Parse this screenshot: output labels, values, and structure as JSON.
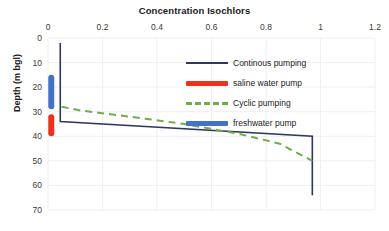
{
  "chart_data": {
    "type": "line",
    "title": "Concentration Isochlors",
    "xlabel": "",
    "ylabel": "Depth (m bgl)",
    "xlim": [
      0,
      1.2
    ],
    "ylim": [
      0,
      70
    ],
    "y_inverted": true,
    "grid": true,
    "legend_position": "inside-top-right",
    "xticks": [
      "0",
      "0.2",
      "0.4",
      "0.6",
      "0.8",
      "1",
      "1.2"
    ],
    "xtick_values": [
      0,
      0.2,
      0.4,
      0.6,
      0.8,
      1,
      1.2
    ],
    "yticks": [
      "0",
      "10",
      "20",
      "30",
      "40",
      "50",
      "60",
      "70"
    ],
    "ytick_values": [
      0,
      10,
      20,
      30,
      40,
      50,
      60,
      70
    ],
    "series": [
      {
        "name": "Continous pumping",
        "type": "line",
        "style": "solid",
        "color": "#2E3A5C",
        "width": 1.6,
        "points": [
          [
            0.045,
            2
          ],
          [
            0.045,
            34
          ],
          [
            0.97,
            40
          ],
          [
            0.97,
            64
          ]
        ]
      },
      {
        "name": "saline water pump",
        "type": "bar",
        "style": "thick-vertical-bar",
        "color": "#E8341C",
        "x": 0.012,
        "depth_top": 31,
        "depth_bottom": 40
      },
      {
        "name": "Cyclic pumping",
        "type": "line",
        "style": "dashed",
        "color": "#70AD47",
        "width": 2,
        "points": [
          [
            0.05,
            28
          ],
          [
            0.12,
            29.5
          ],
          [
            0.3,
            32
          ],
          [
            0.5,
            35
          ],
          [
            0.7,
            39
          ],
          [
            0.85,
            43
          ],
          [
            0.97,
            50
          ]
        ]
      },
      {
        "name": "freshwater pump",
        "type": "bar",
        "style": "thick-vertical-bar",
        "color": "#4472C4",
        "x": 0.012,
        "depth_top": 15,
        "depth_bottom": 29
      }
    ],
    "legend": [
      {
        "label": "Continous pumping",
        "swatch": "line",
        "color": "#2E3A5C"
      },
      {
        "label": "saline water pump",
        "swatch": "bar",
        "color": "#E8341C"
      },
      {
        "label": "Cyclic pumping",
        "swatch": "dash",
        "color": "#70AD47"
      },
      {
        "label": "freshwater pump",
        "swatch": "bar",
        "color": "#4472C4"
      }
    ]
  },
  "colors": {
    "continuous_pumping": "#2E3A5C",
    "saline_water_pump": "#E8341C",
    "cyclic_pumping": "#70AD47",
    "freshwater_pump": "#4472C4",
    "grid": "#EDEFF4",
    "text": "#222222",
    "background": "#FFFFFF"
  }
}
